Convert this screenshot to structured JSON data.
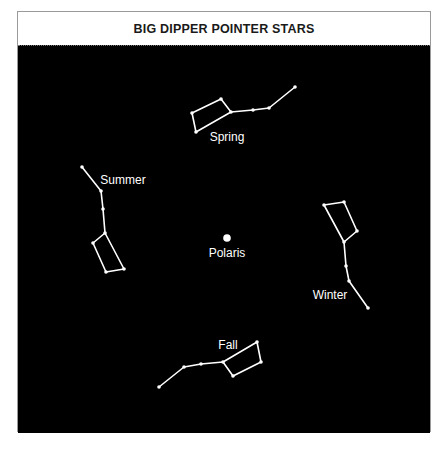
{
  "title": "BIG DIPPER POINTER STARS",
  "colors": {
    "sky": "#000000",
    "star": "#ffffff",
    "line": "#ffffff",
    "frame_border": "#9a9a9a"
  },
  "center": {
    "label": "Polaris",
    "x": 227,
    "y": 238,
    "r": 3.8,
    "label_x": 227,
    "label_y": 257
  },
  "dippers": [
    {
      "season": "Spring",
      "label_x": 227,
      "label_y": 141,
      "stars": [
        [
          192,
          113
        ],
        [
          221,
          99
        ],
        [
          231,
          112
        ],
        [
          196,
          132
        ],
        [
          253,
          110
        ],
        [
          269,
          108
        ],
        [
          295,
          87
        ]
      ],
      "path": [
        [
          196,
          132
        ],
        [
          192,
          113
        ],
        [
          221,
          99
        ],
        [
          231,
          112
        ],
        [
          196,
          132
        ]
      ],
      "handle": [
        [
          231,
          112
        ],
        [
          253,
          110
        ],
        [
          269,
          108
        ],
        [
          295,
          87
        ]
      ]
    },
    {
      "season": "Summer",
      "label_x": 123,
      "label_y": 184,
      "stars": [
        [
          82,
          167
        ],
        [
          101,
          191
        ],
        [
          103,
          209
        ],
        [
          105,
          233
        ],
        [
          93,
          243
        ],
        [
          106,
          272
        ],
        [
          124,
          269
        ]
      ],
      "path": [
        [
          105,
          233
        ],
        [
          93,
          243
        ],
        [
          106,
          272
        ],
        [
          124,
          269
        ],
        [
          105,
          233
        ]
      ],
      "handle": [
        [
          105,
          233
        ],
        [
          103,
          209
        ],
        [
          101,
          191
        ],
        [
          82,
          167
        ]
      ]
    },
    {
      "season": "Winter",
      "label_x": 330,
      "label_y": 299,
      "stars": [
        [
          324,
          205
        ],
        [
          344,
          202
        ],
        [
          357,
          231
        ],
        [
          344,
          242
        ],
        [
          346,
          266
        ],
        [
          349,
          281
        ],
        [
          368,
          308
        ]
      ],
      "path": [
        [
          344,
          242
        ],
        [
          324,
          205
        ],
        [
          344,
          202
        ],
        [
          357,
          231
        ],
        [
          344,
          242
        ]
      ],
      "handle": [
        [
          344,
          242
        ],
        [
          346,
          266
        ],
        [
          349,
          281
        ],
        [
          368,
          308
        ]
      ]
    },
    {
      "season": "Fall",
      "label_x": 228,
      "label_y": 349,
      "stars": [
        [
          159,
          387
        ],
        [
          184,
          367
        ],
        [
          201,
          364
        ],
        [
          223,
          362
        ],
        [
          257,
          342
        ],
        [
          261,
          362
        ],
        [
          233,
          376
        ]
      ],
      "path": [
        [
          223,
          362
        ],
        [
          257,
          342
        ],
        [
          261,
          362
        ],
        [
          233,
          376
        ],
        [
          223,
          362
        ]
      ],
      "handle": [
        [
          223,
          362
        ],
        [
          201,
          364
        ],
        [
          184,
          367
        ],
        [
          159,
          387
        ]
      ]
    }
  ]
}
